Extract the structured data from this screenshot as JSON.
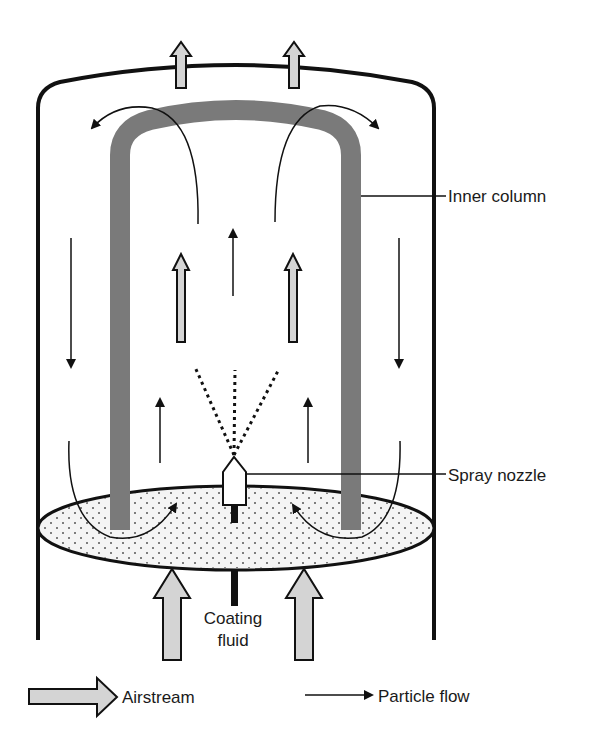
{
  "diagram": {
    "type": "fluidized bed coater (Wurster process) schematic",
    "labels": {
      "inner_column": "Inner column",
      "spray_nozzle": "Spray nozzle",
      "coating_fluid_line1": "Coating",
      "coating_fluid_line2": "fluid"
    },
    "legend": {
      "airstream": "Airstream",
      "particle_flow": "Particle flow"
    },
    "colors": {
      "outline": "#111111",
      "inner_column": "#7a7a7a",
      "airstream_fill": "#d4d4d4",
      "bed_fill": "#f4f4f4",
      "bed_dots": "#555555"
    }
  }
}
